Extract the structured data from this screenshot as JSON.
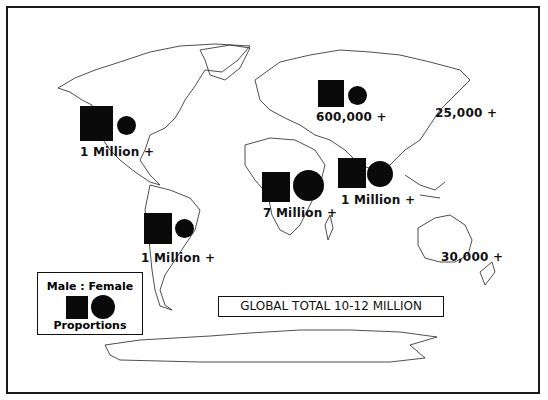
{
  "figure": {
    "title": "GLOBAL TOTAL 10-12 MILLION",
    "legend": {
      "top_label": "Male : Female",
      "bottom_label": "Proportions",
      "male_symbol": "square",
      "female_symbol": "circle"
    },
    "regions": [
      {
        "name": "North America",
        "label": "1 Million +",
        "has_symbols": true
      },
      {
        "name": "South America",
        "label": "1 Million +",
        "has_symbols": true
      },
      {
        "name": "Europe / Russia",
        "label": "600,000 +",
        "has_symbols": true
      },
      {
        "name": "East Asia",
        "label": "25,000 +",
        "has_symbols": false
      },
      {
        "name": "Africa",
        "label": "7 Million +",
        "has_symbols": true
      },
      {
        "name": "South Asia",
        "label": "1 Million +",
        "has_symbols": true
      },
      {
        "name": "Oceania",
        "label": "30,000 +",
        "has_symbols": false
      }
    ],
    "colors": {
      "ink": "#0a0a0a",
      "background": "#ffffff"
    }
  }
}
